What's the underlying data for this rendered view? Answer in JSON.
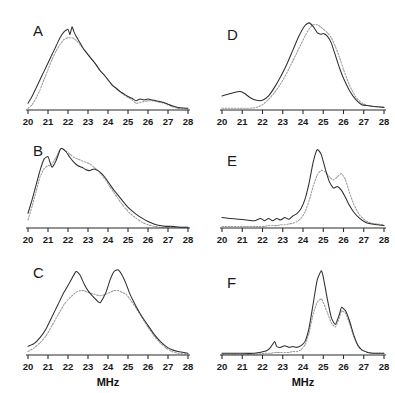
{
  "figure": {
    "background_color": "#ffffff",
    "solid_curve_color": "#2e2e2e",
    "dotted_curve_color": "#9a9a9a",
    "axis_color": "#2b2b2b",
    "axis_title": "MHz",
    "axis_title_b": "MHz",
    "tick_labels": [
      "20",
      "21",
      "22",
      "23",
      "24",
      "25",
      "26",
      "27",
      "28"
    ],
    "panels": [
      {
        "letter": "A"
      },
      {
        "letter": "B"
      },
      {
        "letter": "C"
      },
      {
        "letter": "D"
      },
      {
        "letter": "E"
      },
      {
        "letter": "F"
      }
    ]
  },
  "chart_data": [
    {
      "type": "line",
      "title": "A",
      "xlabel": "MHz",
      "ylabel": "",
      "xlim": [
        20,
        28
      ],
      "ylim": [
        0,
        1
      ],
      "grid": false,
      "legend": "none",
      "x": [
        20.0,
        20.2,
        20.4,
        20.6,
        20.8,
        21.0,
        21.2,
        21.4,
        21.6,
        21.8,
        22.0,
        22.1,
        22.2,
        22.3,
        22.4,
        22.6,
        22.8,
        23.0,
        23.2,
        23.4,
        23.6,
        23.8,
        24.0,
        24.2,
        24.4,
        24.6,
        24.8,
        25.0,
        25.2,
        25.4,
        25.6,
        25.8,
        26.0,
        26.2,
        26.4,
        26.6,
        26.8,
        27.0,
        27.2,
        27.5,
        28.0
      ],
      "series": [
        {
          "name": "solid",
          "style": "solid",
          "values": [
            0.08,
            0.16,
            0.26,
            0.36,
            0.46,
            0.56,
            0.66,
            0.76,
            0.86,
            0.93,
            0.96,
            0.9,
            0.99,
            0.93,
            0.88,
            0.8,
            0.72,
            0.66,
            0.6,
            0.54,
            0.47,
            0.42,
            0.36,
            0.3,
            0.26,
            0.22,
            0.19,
            0.16,
            0.14,
            0.11,
            0.13,
            0.12,
            0.13,
            0.12,
            0.11,
            0.1,
            0.09,
            0.07,
            0.05,
            0.03,
            0.02
          ]
        },
        {
          "name": "dotted",
          "style": "dotted",
          "values": [
            0.02,
            0.06,
            0.14,
            0.24,
            0.36,
            0.48,
            0.6,
            0.7,
            0.78,
            0.84,
            0.86,
            0.86,
            0.86,
            0.85,
            0.83,
            0.78,
            0.72,
            0.66,
            0.6,
            0.54,
            0.47,
            0.42,
            0.36,
            0.3,
            0.26,
            0.22,
            0.18,
            0.15,
            0.12,
            0.08,
            0.09,
            0.1,
            0.11,
            0.11,
            0.1,
            0.09,
            0.08,
            0.06,
            0.04,
            0.02,
            0.01
          ]
        }
      ]
    },
    {
      "type": "line",
      "title": "B",
      "xlabel": "MHz",
      "ylabel": "",
      "xlim": [
        20,
        28
      ],
      "ylim": [
        0,
        1
      ],
      "grid": false,
      "legend": "none",
      "x": [
        20.0,
        20.2,
        20.4,
        20.6,
        20.8,
        21.0,
        21.1,
        21.2,
        21.4,
        21.6,
        21.7,
        21.9,
        22.1,
        22.3,
        22.5,
        22.7,
        22.9,
        23.1,
        23.3,
        23.5,
        23.7,
        23.9,
        24.1,
        24.3,
        24.5,
        24.7,
        24.9,
        25.1,
        25.4,
        25.7,
        26.0,
        26.3,
        26.6,
        26.9,
        27.2,
        27.6,
        28.0
      ],
      "series": [
        {
          "name": "solid",
          "style": "solid",
          "values": [
            0.18,
            0.34,
            0.52,
            0.7,
            0.84,
            0.87,
            0.8,
            0.74,
            0.82,
            0.95,
            0.97,
            0.93,
            0.86,
            0.8,
            0.76,
            0.74,
            0.71,
            0.7,
            0.72,
            0.7,
            0.66,
            0.6,
            0.53,
            0.46,
            0.4,
            0.34,
            0.28,
            0.23,
            0.17,
            0.12,
            0.08,
            0.05,
            0.03,
            0.02,
            0.02,
            0.01,
            0.01
          ]
        },
        {
          "name": "dotted",
          "style": "dotted",
          "values": [
            0.1,
            0.26,
            0.44,
            0.62,
            0.72,
            0.76,
            0.76,
            0.78,
            0.86,
            0.96,
            0.97,
            0.94,
            0.9,
            0.86,
            0.84,
            0.82,
            0.8,
            0.78,
            0.74,
            0.7,
            0.64,
            0.58,
            0.5,
            0.43,
            0.36,
            0.29,
            0.23,
            0.18,
            0.12,
            0.07,
            0.04,
            0.02,
            0.01,
            0.01,
            0.01,
            0.01,
            0.01
          ]
        }
      ]
    },
    {
      "type": "line",
      "title": "C",
      "xlabel": "MHz",
      "ylabel": "",
      "xlim": [
        20,
        28
      ],
      "ylim": [
        0,
        1
      ],
      "grid": false,
      "legend": "none",
      "x": [
        20.0,
        20.3,
        20.6,
        20.9,
        21.2,
        21.5,
        21.8,
        22.1,
        22.4,
        22.6,
        22.8,
        23.0,
        23.3,
        23.6,
        23.9,
        24.1,
        24.3,
        24.5,
        24.7,
        24.9,
        25.1,
        25.4,
        25.7,
        26.0,
        26.3,
        26.6,
        26.9,
        27.2,
        27.5,
        28.0
      ],
      "series": [
        {
          "name": "solid",
          "style": "solid",
          "values": [
            0.1,
            0.13,
            0.2,
            0.3,
            0.44,
            0.58,
            0.72,
            0.84,
            0.96,
            0.92,
            0.82,
            0.74,
            0.66,
            0.6,
            0.72,
            0.86,
            0.96,
            0.98,
            0.92,
            0.82,
            0.7,
            0.56,
            0.44,
            0.34,
            0.24,
            0.16,
            0.1,
            0.06,
            0.04,
            0.02
          ]
        },
        {
          "name": "dotted",
          "style": "dotted",
          "values": [
            0.04,
            0.08,
            0.14,
            0.22,
            0.34,
            0.46,
            0.58,
            0.66,
            0.72,
            0.74,
            0.74,
            0.72,
            0.7,
            0.68,
            0.7,
            0.72,
            0.74,
            0.74,
            0.72,
            0.7,
            0.64,
            0.54,
            0.43,
            0.32,
            0.22,
            0.14,
            0.08,
            0.04,
            0.02,
            0.01
          ]
        }
      ]
    },
    {
      "type": "line",
      "title": "D",
      "xlabel": "MHz",
      "ylabel": "",
      "xlim": [
        20,
        28
      ],
      "ylim": [
        0,
        1
      ],
      "grid": false,
      "legend": "none",
      "x": [
        20.0,
        20.3,
        20.6,
        20.9,
        21.1,
        21.4,
        21.7,
        22.0,
        22.3,
        22.6,
        22.9,
        23.2,
        23.5,
        23.8,
        24.1,
        24.3,
        24.5,
        24.7,
        24.9,
        25.0,
        25.2,
        25.4,
        25.6,
        25.8,
        26.0,
        26.3,
        26.6,
        26.9,
        27.2,
        27.5,
        28.0
      ],
      "series": [
        {
          "name": "solid",
          "style": "solid",
          "values": [
            0.16,
            0.18,
            0.2,
            0.21,
            0.19,
            0.14,
            0.11,
            0.11,
            0.16,
            0.26,
            0.38,
            0.52,
            0.68,
            0.84,
            0.96,
            0.99,
            0.95,
            0.88,
            0.86,
            0.87,
            0.84,
            0.76,
            0.62,
            0.48,
            0.36,
            0.22,
            0.12,
            0.06,
            0.05,
            0.04,
            0.03
          ]
        },
        {
          "name": "dotted",
          "style": "dotted",
          "values": [
            0.02,
            0.02,
            0.02,
            0.02,
            0.02,
            0.02,
            0.03,
            0.06,
            0.12,
            0.2,
            0.3,
            0.42,
            0.56,
            0.7,
            0.84,
            0.92,
            0.97,
            0.97,
            0.94,
            0.92,
            0.88,
            0.82,
            0.72,
            0.6,
            0.46,
            0.28,
            0.15,
            0.08,
            0.05,
            0.04,
            0.03
          ]
        }
      ]
    },
    {
      "type": "line",
      "title": "E",
      "xlabel": "MHz",
      "ylabel": "",
      "xlim": [
        20,
        28
      ],
      "ylim": [
        0,
        1
      ],
      "grid": false,
      "legend": "none",
      "x": [
        20.0,
        20.4,
        20.8,
        21.2,
        21.6,
        21.9,
        22.1,
        22.3,
        22.5,
        22.7,
        22.9,
        23.1,
        23.3,
        23.5,
        23.7,
        23.9,
        24.1,
        24.3,
        24.5,
        24.7,
        24.9,
        25.1,
        25.3,
        25.5,
        25.7,
        25.9,
        26.1,
        26.3,
        26.5,
        26.8,
        27.1,
        27.4,
        27.7,
        28.0
      ],
      "series": [
        {
          "name": "solid",
          "style": "solid",
          "values": [
            0.13,
            0.12,
            0.11,
            0.1,
            0.09,
            0.12,
            0.09,
            0.12,
            0.09,
            0.12,
            0.1,
            0.13,
            0.11,
            0.15,
            0.18,
            0.24,
            0.36,
            0.56,
            0.82,
            0.98,
            0.92,
            0.74,
            0.58,
            0.5,
            0.52,
            0.47,
            0.38,
            0.28,
            0.2,
            0.12,
            0.07,
            0.05,
            0.04,
            0.03
          ]
        },
        {
          "name": "dotted",
          "style": "dotted",
          "values": [
            0.02,
            0.02,
            0.02,
            0.02,
            0.02,
            0.02,
            0.02,
            0.03,
            0.03,
            0.03,
            0.04,
            0.04,
            0.05,
            0.06,
            0.08,
            0.12,
            0.2,
            0.34,
            0.52,
            0.66,
            0.72,
            0.7,
            0.64,
            0.6,
            0.64,
            0.68,
            0.6,
            0.44,
            0.3,
            0.16,
            0.09,
            0.06,
            0.05,
            0.04
          ]
        }
      ]
    },
    {
      "type": "line",
      "title": "F",
      "xlabel": "MHz",
      "ylabel": "",
      "xlim": [
        20,
        28
      ],
      "ylim": [
        0,
        1
      ],
      "grid": false,
      "legend": "none",
      "x": [
        20.0,
        20.8,
        21.6,
        22.2,
        22.4,
        22.6,
        22.7,
        22.9,
        23.1,
        23.3,
        23.5,
        23.7,
        23.9,
        24.1,
        24.3,
        24.5,
        24.7,
        24.9,
        25.0,
        25.2,
        25.4,
        25.6,
        25.8,
        25.9,
        26.1,
        26.3,
        26.5,
        26.7,
        26.9,
        27.2,
        27.5,
        27.8,
        28.0
      ],
      "series": [
        {
          "name": "solid",
          "style": "solid",
          "values": [
            0.02,
            0.02,
            0.02,
            0.05,
            0.09,
            0.16,
            0.1,
            0.09,
            0.11,
            0.09,
            0.1,
            0.09,
            0.11,
            0.16,
            0.32,
            0.6,
            0.88,
            0.99,
            0.92,
            0.66,
            0.44,
            0.36,
            0.48,
            0.56,
            0.52,
            0.4,
            0.24,
            0.12,
            0.06,
            0.03,
            0.02,
            0.02,
            0.02
          ]
        },
        {
          "name": "dotted",
          "style": "dotted",
          "values": [
            0.01,
            0.01,
            0.01,
            0.02,
            0.02,
            0.03,
            0.03,
            0.03,
            0.03,
            0.03,
            0.04,
            0.04,
            0.06,
            0.12,
            0.26,
            0.48,
            0.62,
            0.66,
            0.62,
            0.5,
            0.38,
            0.33,
            0.44,
            0.52,
            0.49,
            0.37,
            0.22,
            0.11,
            0.06,
            0.03,
            0.02,
            0.02,
            0.02
          ]
        }
      ]
    }
  ]
}
